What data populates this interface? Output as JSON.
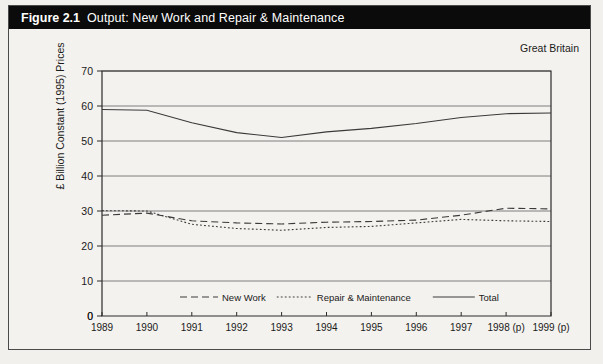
{
  "figure": {
    "number": "Figure 2.1",
    "title": "Output: New Work and Repair & Maintenance",
    "region_note": "Great Britain"
  },
  "chart_data": {
    "type": "line",
    "title": "Output: New Work and Repair & Maintenance",
    "xlabel": "",
    "ylabel": "£ Billion Constant (1995) Prices",
    "ylim": [
      0,
      70
    ],
    "yticks": [
      0,
      10,
      20,
      30,
      40,
      50,
      60,
      70
    ],
    "grid": true,
    "legend_position": "bottom-inside",
    "annotation": "Great Britain",
    "categories": [
      "1989",
      "1990",
      "1991",
      "1992",
      "1993",
      "1994",
      "1995",
      "1996",
      "1997",
      "1998 (p)",
      "1999 (p)"
    ],
    "series": [
      {
        "name": "New Work",
        "style": "dashed",
        "values": [
          28.8,
          29.4,
          27.2,
          26.6,
          26.3,
          26.8,
          27.0,
          27.4,
          28.8,
          30.8,
          30.6
        ]
      },
      {
        "name": "Repair & Maintenance",
        "style": "dotted",
        "values": [
          30.1,
          30.0,
          26.2,
          25.0,
          24.5,
          25.3,
          25.6,
          26.6,
          27.6,
          27.2,
          27.0
        ]
      },
      {
        "name": "Total",
        "style": "solid",
        "values": [
          59.0,
          58.8,
          55.2,
          52.4,
          51.0,
          52.6,
          53.6,
          55.0,
          56.7,
          57.8,
          58.0
        ]
      }
    ]
  },
  "y_axis": {
    "ticks": [
      "0",
      "10",
      "20",
      "30",
      "40",
      "50",
      "60",
      "70"
    ],
    "title": "£ Billion Constant (1995) Prices"
  },
  "x_axis": {
    "ticks": [
      "1989",
      "1990",
      "1991",
      "1992",
      "1993",
      "1994",
      "1995",
      "1996",
      "1997",
      "1998 (p)",
      "1999 (p)"
    ]
  },
  "legend": {
    "items": [
      {
        "label": "New Work",
        "style": "dashed"
      },
      {
        "label": "Repair & Maintenance",
        "style": "dotted"
      },
      {
        "label": "Total",
        "style": "solid"
      }
    ]
  },
  "colors": {
    "banner_bg": "#0b0b0b",
    "banner_text": "#ffffff",
    "page_bg": "#f4f2ee",
    "line": "#3a3a3a",
    "grid": "#6f6f6f"
  }
}
